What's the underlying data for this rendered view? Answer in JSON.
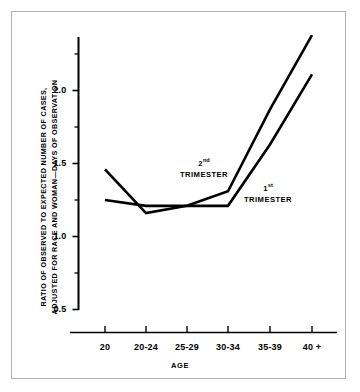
{
  "chart_data": {
    "type": "line",
    "title": "",
    "xlabel": "AGE",
    "ylabel_line1": "RATIO OF OBSERVED TO EXPECTED NUMBER OF CASES,",
    "ylabel_line2": "ADJUSTED FOR RACE AND WOMAN—DAYS OF OBSERVATION",
    "categories": [
      "20",
      "20-24",
      "25-29",
      "30-34",
      "35-39",
      "40 +"
    ],
    "series": [
      {
        "name": "2nd TRIMESTER",
        "name_prefix": "2",
        "name_suffix": "nd",
        "name_word": "TRIMESTER",
        "values": [
          1.46,
          1.16,
          1.21,
          1.31,
          1.87,
          2.38
        ]
      },
      {
        "name": "1st TRIMESTER",
        "name_prefix": "1",
        "name_suffix": "st",
        "name_word": "TRIMESTER",
        "values": [
          1.25,
          1.21,
          1.21,
          1.21,
          1.63,
          2.11
        ]
      }
    ],
    "ylim": [
      0.42,
      2.45
    ],
    "ytick_labels": [
      "0.5",
      "1.0",
      "1.5",
      "2.0"
    ],
    "ytick_values": [
      0.5,
      1.0,
      1.5,
      2.0
    ],
    "yminor_values": [
      0.75,
      1.25,
      1.75,
      2.25
    ],
    "grid": false,
    "legend": "inline-annotations",
    "line_color": "#000000",
    "axis_color": "#000000",
    "border_color": "#b0b0b0",
    "background": "#ffffff"
  }
}
